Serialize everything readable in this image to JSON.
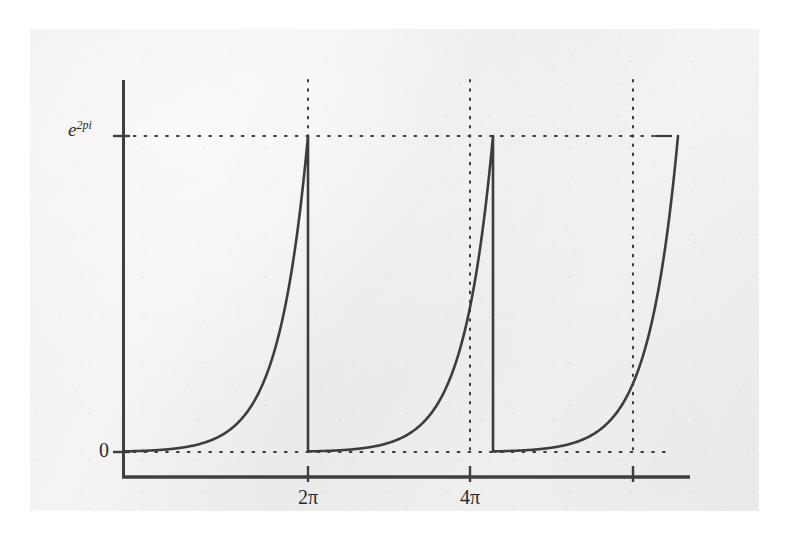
{
  "figure": {
    "background_color": "#f0f0f0",
    "ink_color": "#3a3a3a",
    "media": "scanned-book-page"
  },
  "labels": {
    "y_max_base": "e",
    "y_max_exponent": "2pi",
    "y_zero": "0",
    "x_tick_1": "2π",
    "x_tick_2": "4π"
  },
  "chart_data": {
    "type": "line",
    "title": "",
    "subtitle": "",
    "xlabel": "",
    "ylabel": "",
    "grid": false,
    "legend": "none",
    "x_tick_values": [
      6.2832,
      12.5664
    ],
    "x_tick_labels": [
      "2π",
      "4π"
    ],
    "y_tick_values": [
      0,
      535.49
    ],
    "y_tick_labels": [
      "0",
      "e^{2pi}"
    ],
    "xlim": [
      -0.9,
      21.5
    ],
    "ylim": [
      -60,
      620
    ],
    "reference_lines": {
      "horizontal_dotted_y": 535.49,
      "vertical_dotted_x": [
        6.2832,
        12.5664,
        18.8496
      ]
    },
    "series": [
      {
        "name": "branch-1",
        "x": [
          0.0,
          0.63,
          1.26,
          1.88,
          2.51,
          3.14,
          3.77,
          4.4,
          5.03,
          5.65,
          5.97,
          6.2832
        ],
        "y": [
          1,
          1.87,
          3.51,
          6.59,
          12.35,
          23.14,
          43.38,
          81.31,
          152.41,
          285.68,
          391.0,
          535.49
        ]
      },
      {
        "name": "drop-1",
        "x": [
          6.2832,
          6.2832
        ],
        "y": [
          535.49,
          1
        ]
      },
      {
        "name": "branch-2",
        "x": [
          6.2832,
          6.91,
          7.54,
          8.17,
          8.8,
          9.42,
          10.05,
          10.68,
          11.31,
          11.94,
          12.25,
          12.5664
        ],
        "y": [
          1,
          1.87,
          3.51,
          6.59,
          12.35,
          23.14,
          43.38,
          81.31,
          152.41,
          285.68,
          391.0,
          535.49
        ]
      },
      {
        "name": "drop-2",
        "x": [
          12.5664,
          12.5664
        ],
        "y": [
          535.49,
          1
        ]
      },
      {
        "name": "branch-3",
        "x": [
          12.5664,
          13.19,
          13.82,
          14.45,
          15.08,
          15.71,
          16.34,
          16.96,
          17.59,
          18.22,
          18.54,
          18.8496
        ],
        "y": [
          1,
          1.87,
          3.51,
          6.59,
          12.35,
          23.14,
          43.38,
          81.31,
          152.41,
          285.68,
          391.0,
          535.49
        ]
      }
    ]
  },
  "geometry": {
    "axis_origin_px": {
      "x": 123,
      "y": 477
    },
    "y_axis_top_px": 80,
    "x_axis_right_px": 690,
    "y_zero_px": 452,
    "y_max_px": 136,
    "x_tick_px": [
      308,
      470,
      633
    ]
  }
}
